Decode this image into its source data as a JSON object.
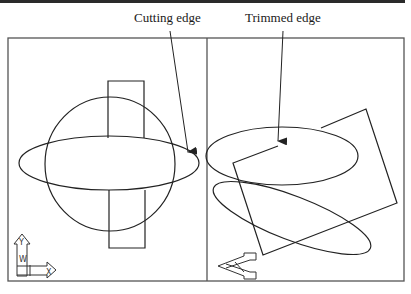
{
  "figure": {
    "labels": {
      "cutting_edge": "Cutting edge",
      "trimmed_edge": "Trimmed edge"
    },
    "left_viewport": {
      "description": "Circle, horizontal ellipse and vertical rectangle; rectangle trimmed inside the ellipse",
      "ucs_icon": {
        "axes": [
          "Y",
          "W",
          "X"
        ]
      }
    },
    "right_viewport": {
      "description": "Isometric view: ellipse, tilted ellipse and rotated rectangle with trimmed edge",
      "ucs_icon": {
        "type": "3d-ucs"
      }
    },
    "colors": {
      "line": "#222222",
      "frame": "#555555",
      "background": "#ffffff"
    }
  }
}
